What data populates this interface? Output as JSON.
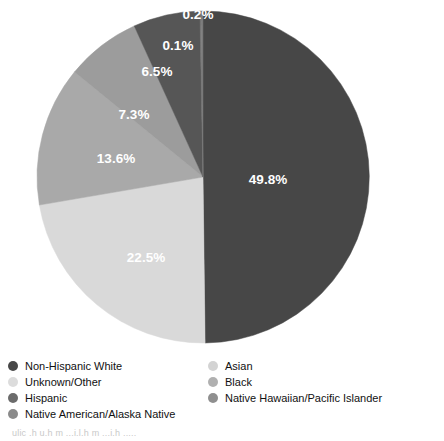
{
  "chart_data": {
    "type": "pie",
    "title": "",
    "xlabel": "",
    "ylabel": "",
    "legend_position": "bottom",
    "grid": false,
    "units": "percent",
    "categories": [
      "Non-Hispanic White",
      "Unknown/Other",
      "Hispanic",
      "Native American/Alaska Native",
      "Asian",
      "Black",
      "Native Hawaiian/Pacific Islander"
    ],
    "values": [
      49.8,
      22.5,
      13.6,
      7.3,
      6.5,
      0.1,
      0.2
    ],
    "slices": [
      {
        "label": "Non-Hispanic White",
        "value": 49.8,
        "display": "49.8%",
        "color": "#474747",
        "start_angle": 0,
        "end_angle": 179.28,
        "label_x": 268,
        "label_y": 180
      },
      {
        "label": "Unknown/Other",
        "value": 22.5,
        "display": "22.5%",
        "color": "#d9d9d9",
        "start_angle": 179.28,
        "end_angle": 260.28,
        "label_x": 146,
        "label_y": 258
      },
      {
        "label": "Hispanic",
        "value": 13.6,
        "display": "13.6%",
        "color": "#a9a9a9",
        "start_angle": 260.28,
        "end_angle": 309.24,
        "label_x": 116,
        "label_y": 159
      },
      {
        "label": "Native American/Alaska Native",
        "value": 7.3,
        "display": "7.3%",
        "color": "#9c9c9c",
        "start_angle": 309.24,
        "end_angle": 335.52,
        "label_x": 134,
        "label_y": 115
      },
      {
        "label": "Asian",
        "value": 6.5,
        "display": "6.5%",
        "color": "#565656",
        "start_angle": 335.52,
        "end_angle": 358.92,
        "label_x": 157,
        "label_y": 72
      },
      {
        "label": "Black",
        "value": 0.1,
        "display": "0.1%",
        "color": "#6e6e6e",
        "start_angle": 358.92,
        "end_angle": 359.28,
        "label_x": 178,
        "label_y": 46
      },
      {
        "label": "Native Hawaiian/Pacific Islander",
        "value": 0.2,
        "display": "0.2%",
        "color": "#7a7a7a",
        "start_angle": 359.28,
        "end_angle": 360,
        "label_x": 198,
        "label_y": 15
      }
    ]
  },
  "legend": {
    "left_column": [
      {
        "label": "Non-Hispanic White",
        "color": "#474747"
      },
      {
        "label": "Unknown/Other",
        "color": "#dcdcdc"
      },
      {
        "label": "Hispanic",
        "color": "#6b6b6b"
      },
      {
        "label": "Native American/Alaska Native",
        "color": "#8a8a8a"
      }
    ],
    "right_column": [
      {
        "label": "Asian",
        "color": "#d3d3d3"
      },
      {
        "label": "Black",
        "color": "#b0b0b0"
      },
      {
        "label": "Native Hawaiian/Pacific Islander",
        "color": "#8f8f8f"
      }
    ]
  },
  "caption": {
    "text": "ulic .h  u.h  m  ...i.l.h   m  ...i.h   ....."
  }
}
